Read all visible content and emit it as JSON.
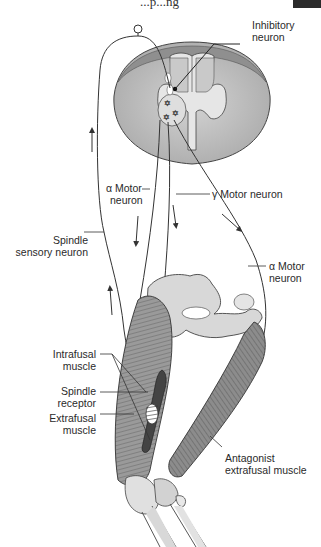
{
  "figure": {
    "top_clipped_text": "...p...ng",
    "labels": {
      "inhibitory_neuron": [
        "Inhibitory",
        "neuron"
      ],
      "alpha_motor_left": [
        "α Motor",
        "neuron"
      ],
      "gamma_motor": "γ Motor neuron",
      "spindle_sensory": [
        "Spindle",
        "sensory neuron"
      ],
      "alpha_motor_right": [
        "α Motor",
        "neuron"
      ],
      "intrafusal": [
        "Intrafusal",
        "muscle"
      ],
      "spindle_receptor": [
        "Spindle",
        "receptor"
      ],
      "extrafusal": [
        "Extrafusal",
        "muscle"
      ],
      "antagonist": [
        "Antagonist",
        "extrafusal muscle"
      ]
    },
    "colors": {
      "white_matter": "#b9b9b9",
      "gray_matter": "#dcdcdc",
      "dorsal_band": "#8f8f8f",
      "muscle": "#8e8e8e",
      "bone": "#d8d8d8",
      "line": "#333333"
    }
  }
}
